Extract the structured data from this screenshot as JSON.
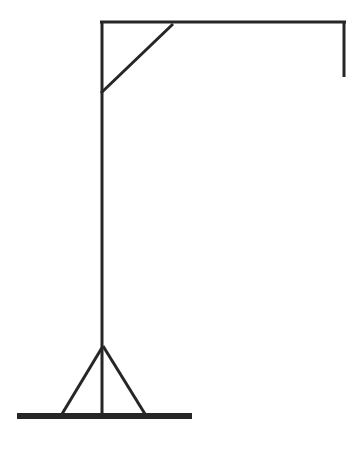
{
  "document": {
    "title": "Gallows / Hangman Frame Line Drawing",
    "type": "monochrome-line-drawing",
    "background_color": "#ffffff",
    "canvas": {
      "width": 364,
      "height": 457
    }
  },
  "style": {
    "line_color": "#262626",
    "thin_stroke_width": 3,
    "base_stroke_width": 6,
    "accent_color": "#262626"
  },
  "figure": {
    "name": "gallows-frame",
    "parts": [
      {
        "name": "top-beam",
        "label": "Top horizontal beam",
        "shape": "line",
        "x1": 100,
        "y1": 22,
        "x2": 346,
        "y2": 22,
        "stroke_width": 3
      },
      {
        "name": "right-drop",
        "label": "Right vertical drop",
        "shape": "line",
        "x1": 344,
        "y1": 21,
        "x2": 344,
        "y2": 77,
        "stroke_width": 3
      },
      {
        "name": "main-post",
        "label": "Main vertical post",
        "shape": "line",
        "x1": 102,
        "y1": 21,
        "x2": 102,
        "y2": 416,
        "stroke_width": 3
      },
      {
        "name": "corner-brace",
        "label": "Diagonal corner brace",
        "shape": "line",
        "x1": 101,
        "y1": 93,
        "x2": 173,
        "y2": 24,
        "stroke_width": 3
      },
      {
        "name": "left-strut",
        "label": "Left support strut",
        "shape": "line",
        "x1": 103,
        "y1": 346,
        "x2": 62,
        "y2": 414,
        "stroke_width": 3
      },
      {
        "name": "right-strut",
        "label": "Right support strut",
        "shape": "line",
        "x1": 103,
        "y1": 346,
        "x2": 145,
        "y2": 414,
        "stroke_width": 3
      },
      {
        "name": "ground-base",
        "label": "Ground base bar",
        "shape": "line",
        "x1": 17,
        "y1": 416,
        "x2": 192,
        "y2": 416,
        "stroke_width": 6
      }
    ]
  }
}
